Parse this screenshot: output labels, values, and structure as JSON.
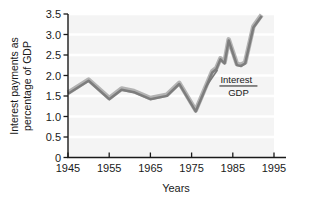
{
  "chart_data": {
    "type": "line",
    "title": "",
    "subtitle": "",
    "xlabel": "Years",
    "ylabel": "Interest payments as percentage of GDP",
    "ylabel_line1": "Interest payments as",
    "ylabel_line2": "percentage of GDP",
    "xlim": [
      1945,
      1995
    ],
    "ylim": [
      0,
      3.5
    ],
    "xticks": [
      1945,
      1955,
      1965,
      1975,
      1985,
      1995
    ],
    "xticklabels": [
      "1945",
      "1955",
      "1965",
      "1975",
      "1985",
      "1995"
    ],
    "yticks": [
      0,
      0.5,
      1.0,
      1.5,
      2.0,
      2.5,
      3.0,
      3.5
    ],
    "yticklabels": [
      "0",
      "0.5",
      "1.0",
      "1.5",
      "2.0",
      "2.5",
      "3.0",
      "3.5"
    ],
    "grid": "horizontal-faint",
    "legend": "none",
    "annotations": [
      {
        "name": "series-label-fraction",
        "numerator": "Interest",
        "denominator": "GDP",
        "x": 1982.0,
        "y": 1.72
      }
    ],
    "series": [
      {
        "name": "Interest/GDP",
        "color": "#7d7d7d",
        "highlight_color": "#b3b3b3",
        "x": [
          1945,
          1950,
          1955,
          1958,
          1961,
          1965,
          1969,
          1972,
          1976,
          1980,
          1981,
          1982,
          1983,
          1984,
          1986,
          1987,
          1988,
          1990,
          1992
        ],
        "values": [
          1.58,
          1.9,
          1.45,
          1.68,
          1.62,
          1.45,
          1.53,
          1.82,
          1.15,
          2.1,
          2.18,
          2.42,
          2.32,
          2.88,
          2.28,
          2.26,
          2.32,
          3.2,
          3.48
        ]
      }
    ]
  },
  "axes": {
    "tick_color": "#1a1a1a",
    "axis_color": "#1a1a1a",
    "plot_background": "#f4f4f4",
    "gridline_color": "#ffffff",
    "figure_background": "#ffffff"
  }
}
